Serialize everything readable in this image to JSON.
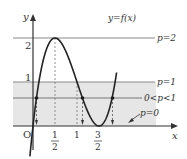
{
  "diagram": {
    "curve_label": "y=f(x)",
    "function": "f(x) = 4x^3 - 12x^2 + 9x",
    "axes": {
      "x_label": "x",
      "y_label": "y",
      "origin_label": "O"
    },
    "y_ticks": [
      {
        "value": 2,
        "label": "2"
      },
      {
        "value": 1,
        "label": "1"
      }
    ],
    "x_ticks": [
      {
        "value": 0.5,
        "num": "1",
        "den": "2"
      },
      {
        "value": 1,
        "label": "1"
      },
      {
        "value": 1.5,
        "num": "3",
        "den": "2"
      }
    ],
    "lines": [
      {
        "name": "p-equals-2",
        "label": "p=2",
        "y": 2
      },
      {
        "name": "p-equals-1",
        "label": "p=1",
        "y": 1
      },
      {
        "name": "p-between-0-1",
        "label": "0<p<1",
        "y": 0.64
      },
      {
        "name": "p-equals-0",
        "label": "p=0",
        "y": 0
      }
    ],
    "shaded_region": {
      "from_y": 0,
      "to_y": 1,
      "color": "#e6e6e6"
    },
    "colors": {
      "curve": "#222222",
      "axis": "#333333",
      "line": "#888888",
      "dashed": "#777777"
    }
  }
}
